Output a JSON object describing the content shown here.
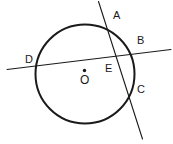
{
  "figure": {
    "type": "circle-geometry-diagram",
    "background_color": "#ffffff",
    "stroke_color": "#1a1a1a",
    "labels": {
      "A": "A",
      "B": "B",
      "C": "C",
      "D": "D",
      "E": "E",
      "O": "O"
    },
    "circle": {
      "center_label": "O",
      "cx": 85,
      "cy": 74,
      "r": 49.5,
      "stroke_width": 2.0
    },
    "center_dot": {
      "cx": 84.5,
      "cy": 70.5,
      "r": 1.6
    },
    "lines": [
      {
        "name": "secant-DB",
        "from_label": "D",
        "to_label": "B",
        "x1": 7,
        "y1": 69.5,
        "x2": 171,
        "y2": 49.5,
        "stroke_width": 1.1
      },
      {
        "name": "secant-AC",
        "from_label": "A",
        "to_label": "C",
        "x1": 98.5,
        "y1": 1.5,
        "x2": 142.5,
        "y2": 139,
        "stroke_width": 1.1
      }
    ],
    "points": [
      {
        "label": "A",
        "x": 110.5,
        "y": 39,
        "on": "circle"
      },
      {
        "label": "B",
        "x": 134.0,
        "y": 45,
        "on": "circle"
      },
      {
        "label": "C",
        "x": 133.5,
        "y": 111,
        "on": "circle"
      },
      {
        "label": "D",
        "x": 36.0,
        "y": 66,
        "on": "circle"
      },
      {
        "label": "E",
        "x": 118.5,
        "y": 64.5,
        "on": "intersection"
      },
      {
        "label": "O",
        "x": 84.5,
        "y": 70.5,
        "on": "center"
      }
    ]
  }
}
